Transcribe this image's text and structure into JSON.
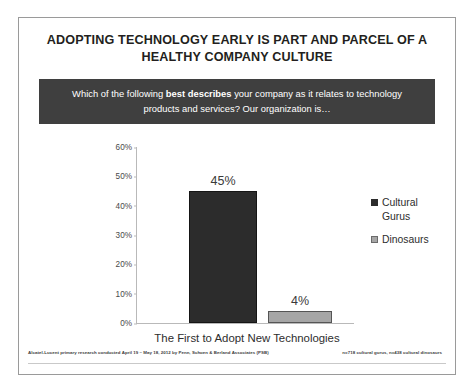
{
  "slide": {
    "title": "ADOPTING TECHNOLOGY EARLY IS PART AND PARCEL OF A HEALTHY COMPANY CULTURE",
    "banner": {
      "part1": "Which of the following ",
      "emphasis": "best describes",
      "part2": " your company as it relates to technology products and services? Our organization is…"
    },
    "footer": {
      "source": "Alcatel-Lucent primary research conducted April 19 – May 18, 2012 by Penn, Schoen & Berland Associates (PSB)",
      "sample": "n=718 cultural gurus, n=438 cultural dinosaurs"
    },
    "colors": {
      "banner_bg": "#3f3f3f",
      "gurus_bar": "#2c2c2c",
      "dinosaurs_bar": "#a6a6a6",
      "frame_border": "#9a9a9a",
      "axis": "#b9b9b9"
    }
  },
  "chart_data": {
    "type": "bar",
    "title": "ADOPTING TECHNOLOGY EARLY IS PART AND PARCEL OF A HEALTHY COMPANY CULTURE",
    "categories": [
      "The First to Adopt New Technologies"
    ],
    "series": [
      {
        "name": "Cultural Gurus",
        "values": [
          45
        ],
        "labels": [
          "45%"
        ],
        "color": "#2c2c2c"
      },
      {
        "name": "Dinosaurs",
        "values": [
          4
        ],
        "labels": [
          "4%"
        ],
        "color": "#a6a6a6"
      }
    ],
    "xlabel": "The First to Adopt New Technologies",
    "ylabel": "",
    "ylim": [
      0,
      60
    ],
    "yticks": [
      "0%",
      "10%",
      "20%",
      "30%",
      "40%",
      "50%",
      "60%"
    ],
    "ytick_values": [
      0,
      10,
      20,
      30,
      40,
      50,
      60
    ],
    "grid": false,
    "legend_position": "right",
    "legend": [
      "Cultural Gurus",
      "Dinosaurs"
    ]
  }
}
